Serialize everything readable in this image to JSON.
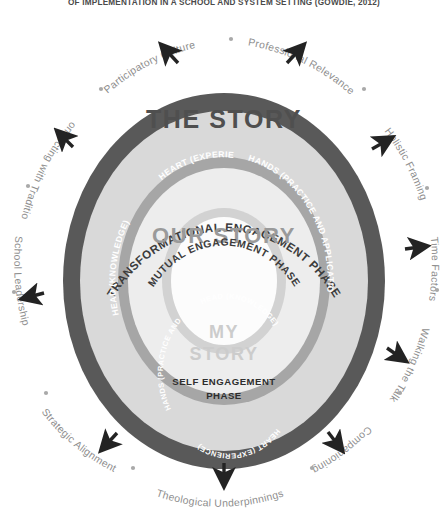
{
  "title": "OF IMPLEMENTATION IN A SCHOOL AND SYSTEM SETTING (GOWDIE, 2012)",
  "colors": {
    "outer_ring": "#595959",
    "band_the_story": "#d9d9d9",
    "band_mid": "#a6a6a6",
    "band_our_story": "#ededed",
    "band_inner": "#d2d2d2",
    "band_my_story": "#fbfbfb",
    "arrow": "#232323",
    "outer_label_text": "#8e8e8e",
    "dot": "#a9a9a9"
  },
  "rings": [
    {
      "id": "the-story",
      "heading": "THE STORY",
      "subheading": "TRANSFORMATIONAL ENGAGEMENT PHASE",
      "heading_color": "#4f4f4f",
      "sub_color": "#3c3c3c",
      "capabilities": [
        "HEAD (KNOWLEDGE)",
        "HEART (EXPERIENCE)",
        "HANDS (PRACTICE AND APPLICATION)"
      ]
    },
    {
      "id": "our-story",
      "heading": "OUR STORY",
      "subheading": "MUTUAL ENGAGEMENT PHASE",
      "heading_color": "#9a9a9a",
      "sub_color": "#3c3c3c",
      "capabilities": [
        "HEAD (KNOWLEDGE)",
        "HEART (EXPERIENCE)",
        "HANDS (PRACTICE AND APPLICATION)"
      ]
    },
    {
      "id": "my-story",
      "heading_line1": "MY",
      "heading_line2": "STORY",
      "subheading_line1": "SELF ENGAGEMENT",
      "subheading_line2": "PHASE",
      "heading_color": "#cccccc",
      "sub_color": "#2e2e2e",
      "capabilities": [
        "HEAD (KNOWLEDGE)",
        "HEART (EXPERIENCE)",
        "HANDS (PRACTICE AND APPLICATION)"
      ]
    }
  ],
  "enablers": [
    "Participatory Culture",
    "Professional Relevance",
    "Holistic Framing",
    "Time Factors",
    "Walking the Talk",
    "Companioning",
    "Theological Underpinnings",
    "Strategic Alignment",
    "School Leadership",
    "Connecting with Tradition"
  ]
}
